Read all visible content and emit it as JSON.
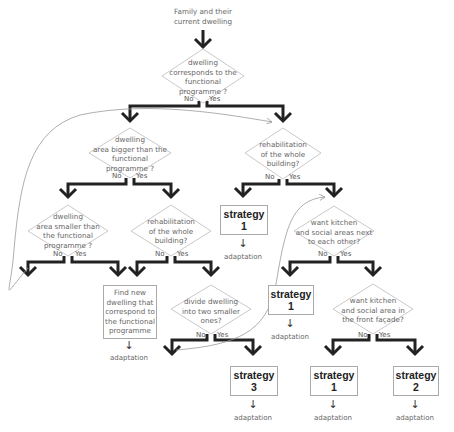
{
  "start": {
    "text": "Family and their\ncurrent dwelling"
  },
  "decisions": [
    {
      "id": "d1",
      "text": "dwelling\ncorresponds to the\nfunctional\nprogramme ?"
    },
    {
      "id": "d2",
      "text": "dwelling\narea bigger than the\nfunctional\nprogramme ?"
    },
    {
      "id": "d3",
      "text": "rehabilitation\nof the whole\nbuilding?"
    },
    {
      "id": "d4",
      "text": "dwelling\narea smaller than\nthe functional\nprogramme ?"
    },
    {
      "id": "d5",
      "text": "rehabilitation\nof the whole\nbuilding?"
    },
    {
      "id": "d6",
      "text": "want kitchen\nand social areas next\nto each other?"
    },
    {
      "id": "d7",
      "text": "divide dwelling\ninto two smaller\nones?"
    },
    {
      "id": "d8",
      "text": "want kitchen\nand social area in\nthe front façade?"
    }
  ],
  "branch_labels": {
    "no": "No",
    "yes": "Yes"
  },
  "outcomes": [
    {
      "id": "s1a",
      "title": "strategy",
      "number": "1",
      "after": "adaptation"
    },
    {
      "id": "find",
      "text": "Find new\ndwelling that\ncorrespond to\nthe functional\nprogramme",
      "after": "adaptation"
    },
    {
      "id": "s1b",
      "title": "strategy",
      "number": "1",
      "after": "adaptation"
    },
    {
      "id": "s3",
      "title": "strategy",
      "number": "3",
      "after": "adaptation"
    },
    {
      "id": "s1c",
      "title": "strategy",
      "number": "1",
      "after": "adaptation"
    },
    {
      "id": "s2",
      "title": "strategy",
      "number": "2",
      "after": "adaptation"
    }
  ],
  "arrow_glyph": "↓"
}
